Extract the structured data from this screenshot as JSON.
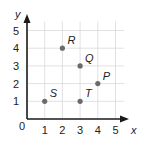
{
  "chart_data": {
    "type": "scatter",
    "title": "",
    "xlabel": "x",
    "ylabel": "y",
    "xlim": [
      0,
      5.5
    ],
    "ylim": [
      0,
      5.5
    ],
    "grid": true,
    "x_ticks": [
      "1",
      "2",
      "3",
      "4",
      "5"
    ],
    "y_ticks": [
      "1",
      "2",
      "3",
      "4",
      "5"
    ],
    "origin_label": "0",
    "points": [
      {
        "label": "R",
        "x": 2,
        "y": 4
      },
      {
        "label": "Q",
        "x": 3,
        "y": 3
      },
      {
        "label": "P",
        "x": 4,
        "y": 2
      },
      {
        "label": "S",
        "x": 1,
        "y": 1
      },
      {
        "label": "T",
        "x": 3,
        "y": 1
      }
    ]
  },
  "colors": {
    "grid": "#d9d9d9",
    "axis": "#1a1a1a",
    "point": "#6b6b6b",
    "text": "#222222"
  }
}
